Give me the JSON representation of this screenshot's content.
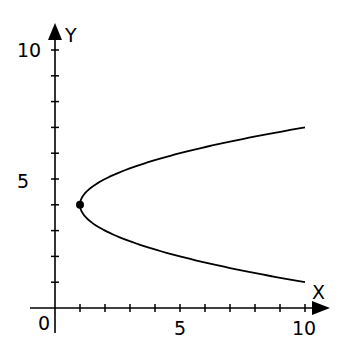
{
  "chart_data": {
    "type": "line",
    "title": "",
    "xlabel": "X",
    "ylabel": "Y",
    "xlim": [
      0,
      10
    ],
    "ylim": [
      0,
      10
    ],
    "x_tick_labels": [
      {
        "value": 0,
        "label": "0"
      },
      {
        "value": 5,
        "label": "5"
      },
      {
        "value": 10,
        "label": "10"
      }
    ],
    "y_tick_labels": [
      {
        "value": 5,
        "label": "5"
      },
      {
        "value": 10,
        "label": "10"
      }
    ],
    "minor_tick_step": 1,
    "grid": false,
    "legend": null,
    "series": [
      {
        "name": "parabola x = (y - 4)^2 + 1",
        "equation": "x = (y - 4)^2 + 1",
        "orientation": "opens right",
        "points": [
          {
            "x": 10,
            "y": 7
          },
          {
            "x": 7.25,
            "y": 6.5
          },
          {
            "x": 5,
            "y": 6
          },
          {
            "x": 3.25,
            "y": 5.5
          },
          {
            "x": 2,
            "y": 5
          },
          {
            "x": 1.25,
            "y": 4.5
          },
          {
            "x": 1,
            "y": 4
          },
          {
            "x": 1.25,
            "y": 3.5
          },
          {
            "x": 2,
            "y": 3
          },
          {
            "x": 3.25,
            "y": 2.5
          },
          {
            "x": 5,
            "y": 2
          },
          {
            "x": 7.25,
            "y": 1.5
          },
          {
            "x": 10,
            "y": 1
          }
        ]
      }
    ],
    "annotations": [
      {
        "type": "point",
        "label": "vertex",
        "x": 1,
        "y": 4
      }
    ]
  }
}
